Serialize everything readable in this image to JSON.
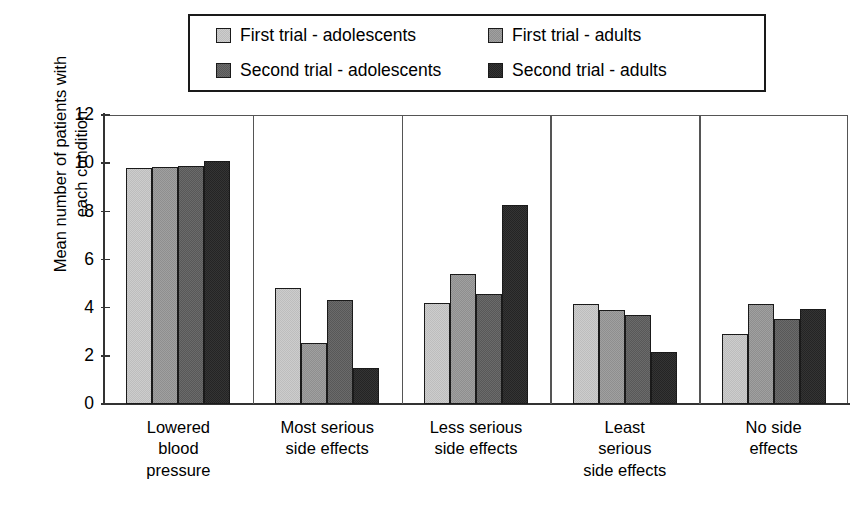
{
  "chart_data": {
    "type": "bar",
    "title": "",
    "xlabel": "",
    "ylabel": "Mean number of patients with each condition",
    "ylim": [
      0,
      12
    ],
    "yticks": [
      "0",
      "2",
      "4",
      "6",
      "8",
      "10",
      "12"
    ],
    "grid": false,
    "legend_position": "top",
    "categories": [
      "Lowered\nblood\npressure",
      "Most serious\nside effects",
      "Less serious\nside effects",
      "Least\nserious\nside effects",
      "No side\neffects"
    ],
    "series": [
      {
        "name": "First trial - adolescents",
        "color": "#cdcdcd",
        "values": [
          9.8,
          4.8,
          4.2,
          4.15,
          2.9
        ]
      },
      {
        "name": "First trial - adults",
        "color": "#a0a0a0",
        "values": [
          9.85,
          2.55,
          5.4,
          3.9,
          4.15
        ]
      },
      {
        "name": "Second trial - adolescents",
        "color": "#6b6b6b",
        "values": [
          9.9,
          4.3,
          4.55,
          3.7,
          3.55
        ]
      },
      {
        "name": "Second trial - adults",
        "color": "#343434",
        "values": [
          10.1,
          1.5,
          8.25,
          2.15,
          3.95
        ]
      }
    ]
  },
  "axis": {
    "y_title_line1": "Mean number of patients with",
    "y_title_line2": "each condition"
  }
}
